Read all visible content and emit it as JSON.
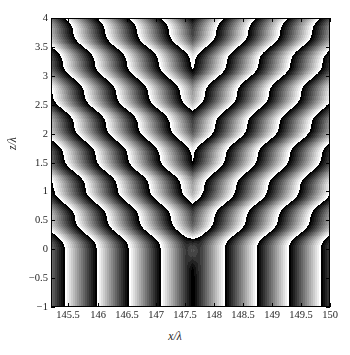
{
  "figure": {
    "background_color": "#ffffff",
    "width": 350,
    "height": 355
  },
  "axes": {
    "frame_color": "#000000",
    "x_axis": {
      "title": "x/λ",
      "min": 145.2,
      "max": 150.0,
      "tick_values": [
        145.5,
        146,
        146.5,
        147,
        147.5,
        148,
        148.5,
        149,
        149.5,
        150
      ],
      "tick_labels": [
        "145.5",
        "146",
        "146.5",
        "147",
        "147.5",
        "148",
        "148.5",
        "149",
        "149.5",
        "150"
      ]
    },
    "y_axis": {
      "title": "z/λ",
      "min": -1.0,
      "max": 4.0,
      "tick_values": [
        -1,
        -0.5,
        0,
        0.5,
        1,
        1.5,
        2,
        2.5,
        3,
        3.5,
        4
      ],
      "tick_labels": [
        "−1",
        "−0.5",
        "0",
        "0.5",
        "1",
        "1.5",
        "2",
        "2.5",
        "3",
        "3.5",
        "4"
      ]
    }
  },
  "chart_data": {
    "type": "heatmap",
    "title": "",
    "subtitle": "",
    "xlabel": "x/λ",
    "ylabel": "z/λ",
    "xlim": [
      145.2,
      150.0
    ],
    "ylim": [
      -1.0,
      4.0
    ],
    "grid": false,
    "legend": "none",
    "colormap": "gray",
    "colormap_levels": 16,
    "value_description": "wrapped phase (sawtooth), black = low, white = high",
    "zlim": [
      0,
      1
    ],
    "xtick_labels": [
      "145.5",
      "146",
      "146.5",
      "147",
      "147.5",
      "148",
      "148.5",
      "149",
      "149.5",
      "150"
    ],
    "xtick_values": [
      145.5,
      146,
      146.5,
      147,
      147.5,
      148,
      148.5,
      149,
      149.5,
      150
    ],
    "ytick_labels": [
      "−1",
      "−0.5",
      "0",
      "0.5",
      "1",
      "1.5",
      "2",
      "2.5",
      "3",
      "3.5",
      "4"
    ],
    "ytick_values": [
      -1,
      -0.5,
      0,
      0.5,
      1,
      1.5,
      2,
      2.5,
      3,
      3.5,
      4
    ],
    "features": {
      "cusp_focus_x": 147.62,
      "cusp_focus_z": 0.0,
      "symmetry_axis_x": 147.62,
      "below_focus_pattern": "near-vertical straight fringes",
      "above_focus_pattern": "chevron / V-shaped diagonal fringes with staircase modulation",
      "diagonal_slope_dz_dx": 1.45,
      "vertical_step_period_z": 0.54,
      "horizontal_fringe_period_x": 0.55,
      "n_fringe_periods_bottom_edge": 5,
      "n_staircase_steps_vertical": 9
    },
    "gray_levels": [
      "#000000",
      "#151515",
      "#2a2a2a",
      "#3f3f3f",
      "#555555",
      "#6a6a6a",
      "#7f7f7f",
      "#949494",
      "#a9a9a9",
      "#bebebe",
      "#d4d4d4",
      "#e9e9e9",
      "#ffffff"
    ]
  },
  "render": {
    "plot_left_px": 51,
    "plot_top_px": 18,
    "plot_width_px": 279,
    "plot_height_px": 289
  }
}
